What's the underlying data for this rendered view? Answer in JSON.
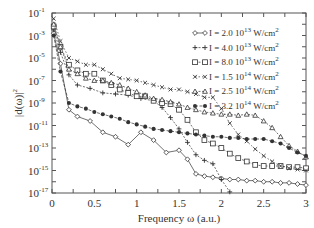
{
  "chart_data": {
    "type": "line",
    "title": "",
    "xlabel": "Frequency ω (a.u.)",
    "ylabel": "|d(ω)|²",
    "xlim": [
      0,
      3
    ],
    "ylim_log10": [
      -17,
      -1
    ],
    "yscale": "log",
    "grid": false,
    "legend_position": "upper right",
    "x_ticks": [
      {
        "v": 0,
        "label": "0"
      },
      {
        "v": 0.5,
        "label": "0.5"
      },
      {
        "v": 1,
        "label": "1"
      },
      {
        "v": 1.5,
        "label": "1.5"
      },
      {
        "v": 2,
        "label": "2"
      },
      {
        "v": 2.5,
        "label": "2.5"
      },
      {
        "v": 3,
        "label": "3"
      }
    ],
    "y_ticks": [
      {
        "exp": -1,
        "label": "10",
        "sup": "-1"
      },
      {
        "exp": -3,
        "label": "10",
        "sup": "-3"
      },
      {
        "exp": -5,
        "label": "10",
        "sup": "-5"
      },
      {
        "exp": -7,
        "label": "10",
        "sup": "-7"
      },
      {
        "exp": -9,
        "label": "10",
        "sup": "-9"
      },
      {
        "exp": -11,
        "label": "10",
        "sup": "-11"
      },
      {
        "exp": -13,
        "label": "10",
        "sup": "-13"
      },
      {
        "exp": -15,
        "label": "10",
        "sup": "-15"
      },
      {
        "exp": -17,
        "label": "10",
        "sup": "-17"
      }
    ],
    "series": [
      {
        "name": "I = 2.0 10^13 W/cm^2",
        "legend_main": "I = 2.0 10",
        "legend_exp": "13",
        "legend_unit": " W/cm",
        "legend_unit_exp": "2",
        "marker": "diamond",
        "x": [
          0.02,
          0.1,
          0.2,
          0.3,
          0.45,
          0.6,
          0.75,
          0.9,
          1.05,
          1.2,
          1.35,
          1.5,
          1.6,
          1.7,
          1.8,
          1.9,
          2.0,
          2.1,
          2.2,
          2.3,
          2.4,
          2.5,
          2.6,
          2.7,
          2.8,
          2.9,
          3.0
        ],
        "log10_y": [
          -2.8,
          -5.5,
          -9.6,
          -10.2,
          -10.6,
          -11.6,
          -12.0,
          -12.7,
          -11.6,
          -12.3,
          -13.4,
          -13.2,
          -14.0,
          -15.3,
          -15.5,
          -15.6,
          -15.7,
          -15.8,
          -15.8,
          -15.9,
          -15.9,
          -16.0,
          -16.0,
          -16.1,
          -16.1,
          -16.2,
          -16.3
        ]
      },
      {
        "name": "I = 4.0 10^13 W/cm^2",
        "legend_main": "I = 4.0 10",
        "legend_exp": "13",
        "legend_unit": " W/cm",
        "legend_unit_exp": "2",
        "marker": "plus",
        "x": [
          0.02,
          0.1,
          0.2,
          0.3,
          0.45,
          0.6,
          0.75,
          0.9,
          1.05,
          1.2,
          1.3,
          1.4,
          1.5,
          1.6,
          1.7,
          1.8,
          1.9,
          2.0,
          2.1
        ],
        "log10_y": [
          -2.5,
          -4.5,
          -6.5,
          -7.4,
          -7.7,
          -8.1,
          -8.2,
          -8.3,
          -8.6,
          -8.8,
          -9.4,
          -10.3,
          -11.3,
          -12.5,
          -13.6,
          -14.1,
          -14.4,
          -15.8,
          -16.9
        ]
      },
      {
        "name": "I = 8.0 10^13 W/cm^2",
        "legend_main": "I = 8.0 10",
        "legend_exp": "13",
        "legend_unit": " W/cm",
        "legend_unit_exp": "2",
        "marker": "square",
        "x": [
          0.02,
          0.1,
          0.2,
          0.3,
          0.4,
          0.5,
          0.6,
          0.7,
          0.8,
          0.9,
          1.0,
          1.1,
          1.2,
          1.3,
          1.4,
          1.5,
          1.6,
          1.7,
          1.8,
          1.9,
          2.0,
          2.1,
          2.2,
          2.3,
          2.4,
          2.5,
          2.6,
          2.7,
          2.8,
          2.9,
          3.0
        ],
        "log10_y": [
          -2.2,
          -4.0,
          -5.6,
          -6.1,
          -6.4,
          -6.4,
          -7.0,
          -7.4,
          -7.8,
          -8.1,
          -8.4,
          -8.4,
          -8.8,
          -9.0,
          -9.1,
          -9.6,
          -10.5,
          -11.6,
          -12.3,
          -12.6,
          -13.0,
          -13.5,
          -13.9,
          -14.2,
          -14.5,
          -14.6,
          -14.6,
          -14.6,
          -14.7,
          -14.7,
          -14.8
        ]
      },
      {
        "name": "I = 1.5 10^14 W/cm^2",
        "legend_main": "I = 1.5 10",
        "legend_exp": "14",
        "legend_unit": " W/cm",
        "legend_unit_exp": "2",
        "marker": "x",
        "x": [
          0.02,
          0.1,
          0.2,
          0.3,
          0.4,
          0.5,
          0.6,
          0.7,
          0.8,
          0.9,
          1.0,
          1.1,
          1.2,
          1.3,
          1.4,
          1.5,
          1.6,
          1.7,
          1.8,
          1.9,
          2.0,
          2.1,
          2.2,
          2.3,
          2.4,
          2.5,
          2.6,
          2.7,
          2.8,
          2.9,
          3.0
        ],
        "log10_y": [
          -1.5,
          -3.5,
          -5.0,
          -5.3,
          -5.6,
          -5.6,
          -6.0,
          -6.4,
          -6.8,
          -6.9,
          -7.0,
          -7.2,
          -7.4,
          -7.6,
          -7.8,
          -7.8,
          -8.0,
          -8.2,
          -8.5,
          -8.5,
          -9.5,
          -10.8,
          -11.8,
          -12.4,
          -13.1,
          -13.7,
          -14.2,
          -14.6,
          -14.8,
          -14.9,
          -15.0
        ]
      },
      {
        "name": "I = 2.5 10^14 W/cm^2",
        "legend_main": "I = 2.5 10",
        "legend_exp": "14",
        "legend_unit": " W/cm",
        "legend_unit_exp": "2",
        "marker": "triangle",
        "x": [
          0.02,
          0.1,
          0.2,
          0.3,
          0.4,
          0.5,
          0.6,
          0.7,
          0.8,
          0.9,
          1.0,
          1.1,
          1.2,
          1.3,
          1.4,
          1.5,
          1.6,
          1.7,
          1.8,
          1.9,
          2.0,
          2.1,
          2.2,
          2.3,
          2.4,
          2.5,
          2.6,
          2.7,
          2.8,
          2.9,
          3.0
        ],
        "log10_y": [
          -2.0,
          -4.0,
          -6.0,
          -6.4,
          -6.8,
          -7.0,
          -7.0,
          -7.2,
          -7.4,
          -7.7,
          -8.0,
          -8.3,
          -8.6,
          -8.7,
          -8.9,
          -9.1,
          -9.4,
          -9.6,
          -9.8,
          -9.9,
          -10.0,
          -10.0,
          -10.1,
          -10.0,
          -10.1,
          -10.6,
          -11.2,
          -12.0,
          -12.8,
          -13.3,
          -13.8
        ]
      },
      {
        "name": "I = 3.2 10^14 W/cm^2",
        "legend_main": "I = 3.2 10",
        "legend_exp": "14",
        "legend_unit": " W/cm",
        "legend_unit_exp": "2",
        "marker": "filled-circle",
        "x": [
          0.02,
          0.1,
          0.2,
          0.3,
          0.4,
          0.5,
          0.6,
          0.7,
          0.8,
          0.9,
          1.0,
          1.1,
          1.2,
          1.3,
          1.4,
          1.5,
          1.6,
          1.7,
          1.8,
          1.9,
          2.0,
          2.1,
          2.2,
          2.3,
          2.4,
          2.5,
          2.6,
          2.7,
          2.8,
          2.9,
          3.0
        ],
        "log10_y": [
          -3.0,
          -6.2,
          -9.0,
          -9.3,
          -9.5,
          -9.8,
          -10.0,
          -10.2,
          -10.4,
          -10.7,
          -10.9,
          -11.1,
          -11.3,
          -11.4,
          -11.5,
          -11.6,
          -11.7,
          -11.8,
          -11.9,
          -12.0,
          -12.0,
          -12.1,
          -12.1,
          -12.2,
          -12.2,
          -12.2,
          -12.4,
          -12.6,
          -13.0,
          -13.4,
          -13.7
        ]
      }
    ]
  },
  "plot": {
    "left": 52,
    "right": 306,
    "top": 13,
    "bottom": 193,
    "stroke": "#555555",
    "series_color": "#333333"
  }
}
